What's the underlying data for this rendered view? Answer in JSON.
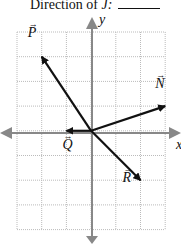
{
  "title": {
    "prefix": "Direction of ",
    "var": "J:",
    "blank": ""
  },
  "axes": {
    "x_label": "x",
    "y_label": "y"
  },
  "grid": {
    "cols": 6,
    "rows": 8,
    "origin_col": 3,
    "origin_row": 4
  },
  "vectors": [
    {
      "name": "P",
      "dx": -2,
      "dy": 3
    },
    {
      "name": "N",
      "dx": 3,
      "dy": 1
    },
    {
      "name": "Q",
      "dx": -1,
      "dy": 0
    },
    {
      "name": "R",
      "dx": 2,
      "dy": -2
    }
  ],
  "colors": {
    "grid": "#bbbbbb",
    "axis": "#888888",
    "vector": "#111111"
  }
}
